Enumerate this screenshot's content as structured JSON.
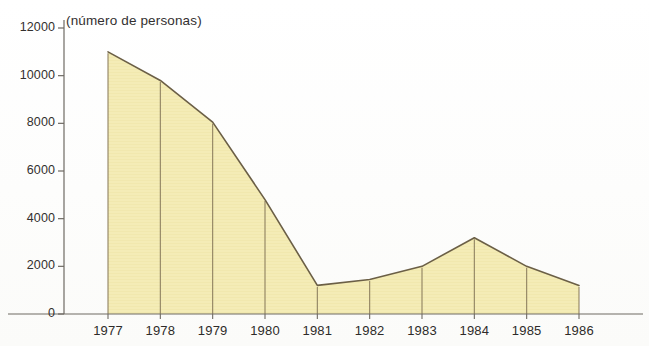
{
  "chart_data": {
    "type": "area",
    "title": "(número de personas)",
    "xlabel": "",
    "ylabel": "",
    "categories": [
      "1977",
      "1978",
      "1979",
      "1980",
      "1981",
      "1982",
      "1983",
      "1984",
      "1985",
      "1986"
    ],
    "values": [
      11000,
      9800,
      8050,
      4800,
      1200,
      1450,
      2000,
      3200,
      2000,
      1200
    ],
    "series": [
      {
        "name": "número de personas",
        "values": [
          11000,
          9800,
          8050,
          4800,
          1200,
          1450,
          2000,
          3200,
          2000,
          1200
        ]
      }
    ],
    "ylim": [
      0,
      12000
    ],
    "y_ticks": [
      0,
      2000,
      4000,
      6000,
      8000,
      10000,
      12000
    ],
    "y_tick_labels": [
      "0",
      "2000",
      "4000",
      "6000",
      "8000",
      "10000",
      "12000"
    ],
    "grid": false,
    "legend": "none",
    "fill_color": "#f4ecb6",
    "line_color": "#6b5f46",
    "axis_color": "#6e6a63",
    "vertical_dividers": true
  },
  "axes": {
    "y_title": "(número de personas)"
  }
}
